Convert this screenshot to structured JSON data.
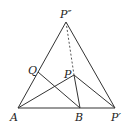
{
  "diagram": {
    "type": "geometry",
    "points": {
      "A": {
        "label": "A",
        "x": 18,
        "y": 108
      },
      "B": {
        "label": "B",
        "x": 80,
        "y": 108
      },
      "Pp": {
        "label": "P′",
        "x": 115,
        "y": 108
      },
      "Ppp": {
        "label": "P″",
        "x": 66,
        "y": 22
      },
      "P": {
        "label": "P",
        "x": 74,
        "y": 75
      },
      "Q": {
        "label": "Q",
        "x": 38,
        "y": 72
      }
    },
    "segments": [
      [
        "A",
        "Pp"
      ],
      [
        "A",
        "Ppp"
      ],
      [
        "Ppp",
        "Pp"
      ],
      [
        "A",
        "P"
      ],
      [
        "P",
        "B"
      ],
      [
        "P",
        "Pp"
      ],
      [
        "Q",
        "B"
      ]
    ],
    "dashed_segments": [
      [
        "Ppp",
        "P"
      ]
    ]
  }
}
